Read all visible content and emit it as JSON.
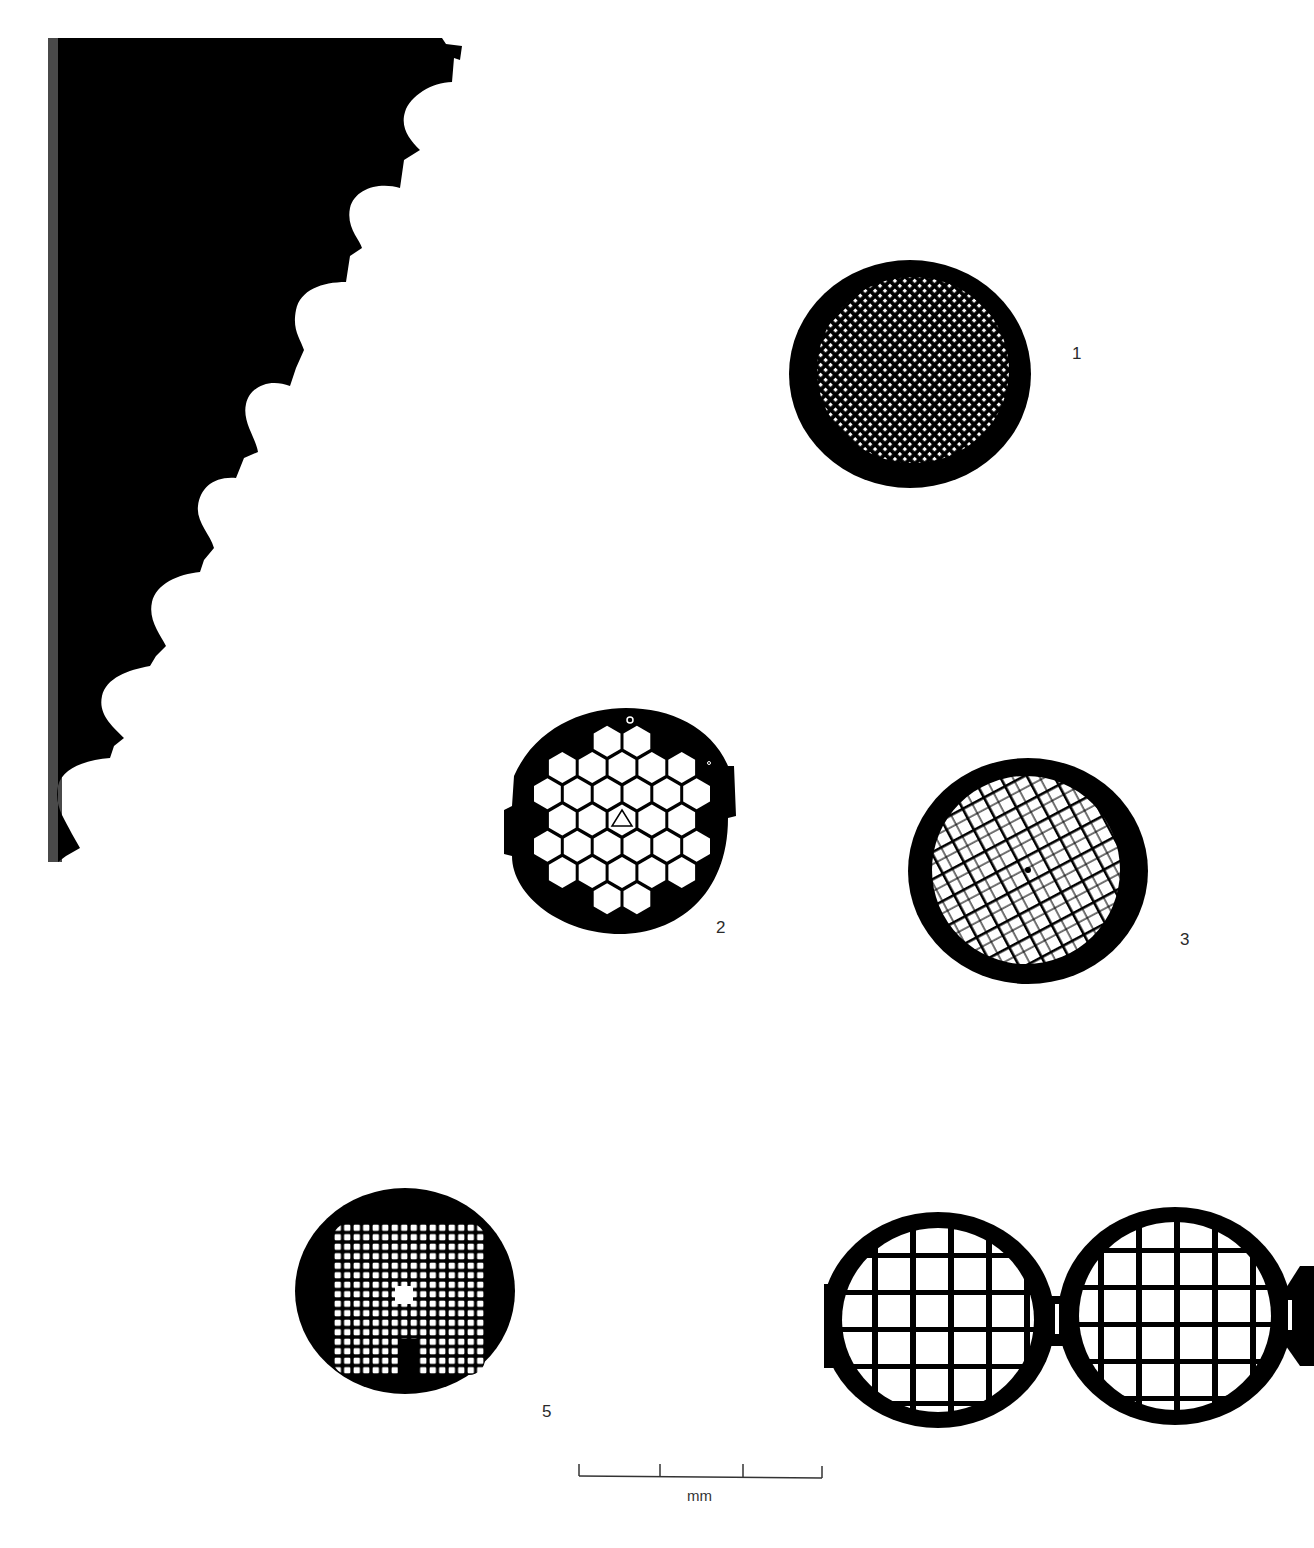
{
  "plate": {
    "description": "Plate of electron microscope specimen grids with scale bar",
    "figures": [
      {
        "id": "fig-1",
        "label": "1",
        "type": "fine-square-mesh-round-grid"
      },
      {
        "id": "fig-2",
        "label": "2",
        "type": "hexagonal-mesh-grid-with-tabs"
      },
      {
        "id": "fig-3",
        "label": "3",
        "type": "diagonal-square-mesh-grid"
      },
      {
        "id": "fig-4",
        "label": "",
        "type": "folding-double-grid"
      },
      {
        "id": "fig-5",
        "label": "5",
        "type": "square-mesh-grid-with-slot"
      }
    ],
    "scale_bar": {
      "unit_label": "mm",
      "divisions": 3
    },
    "colors": {
      "ink": "#000000",
      "paper": "#ffffff",
      "label_text": "#2a2a2a",
      "edge_gray": "#4a4a4a"
    }
  }
}
